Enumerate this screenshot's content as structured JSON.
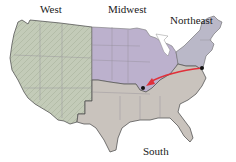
{
  "map": {
    "title": "",
    "regions": [
      {
        "name": "West",
        "color": "#bfc8b4"
      },
      {
        "name": "Midwest",
        "color": "#bbb0cc"
      },
      {
        "name": "Northeast",
        "color": "#b9b7c6"
      },
      {
        "name": "South",
        "color": "#c8c2bd"
      }
    ],
    "labels": {
      "west": "West",
      "midwest": "Midwest",
      "northeast": "Northeast",
      "south": "South"
    },
    "route": {
      "color": "#e0303a",
      "from": "Northeast (Mid-Atlantic point)",
      "to": "Midwest (southern point)",
      "points": [
        {
          "label": "origin",
          "x": 202,
          "y": 68
        },
        {
          "label": "destination",
          "x": 143,
          "y": 88
        }
      ]
    },
    "colors": {
      "outline": "#444444",
      "state_borders": "#8d8a92",
      "marker": "#111111"
    }
  }
}
